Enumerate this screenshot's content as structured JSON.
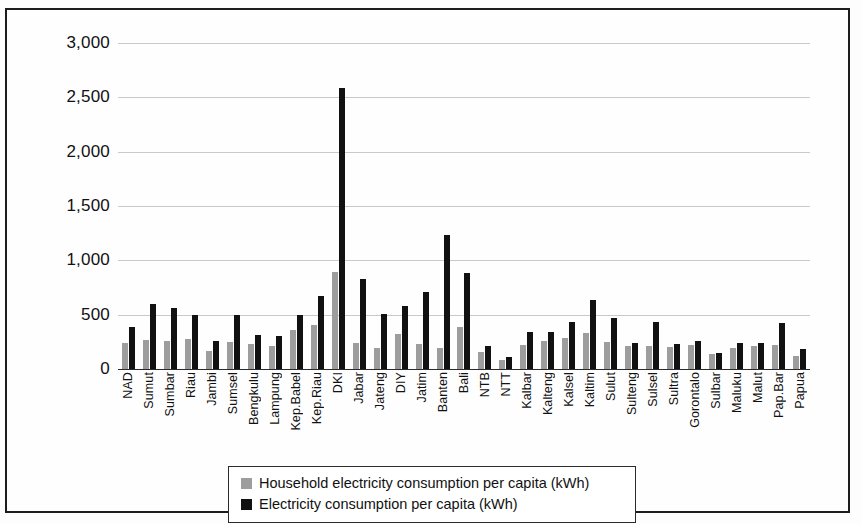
{
  "chart_data": {
    "type": "bar",
    "title": "",
    "xlabel": "",
    "ylabel": "",
    "ylim": [
      0,
      3000
    ],
    "ytick_labels": [
      "0",
      "500",
      "1,000",
      "1,500",
      "2,000",
      "2,500",
      "3,000"
    ],
    "ytick_values": [
      0,
      500,
      1000,
      1500,
      2000,
      2500,
      3000
    ],
    "grid": true,
    "legend_position": "bottom-center",
    "categories": [
      "NAD",
      "Sumut",
      "Sumbar",
      "Riau",
      "Jambi",
      "Sumsel",
      "Bengkulu",
      "Lampung",
      "Kep.Babel",
      "Kep.Riau",
      "DKI",
      "Jabar",
      "Jateng",
      "DIY",
      "Jatim",
      "Banten",
      "Bali",
      "NTB",
      "NTT",
      "Kalbar",
      "Kalteng",
      "Kalsel",
      "Kaltim",
      "Sulut",
      "Sulteng",
      "Sulsel",
      "Sultra",
      "Gorontalo",
      "Sulbar",
      "Maluku",
      "Malut",
      "Pap.Bar",
      "Papua"
    ],
    "series": [
      {
        "name": "Household electricity consumption per capita (kWh)",
        "color": "#9d9d9d",
        "values": [
          235,
          270,
          260,
          275,
          170,
          250,
          230,
          215,
          355,
          405,
          890,
          240,
          195,
          320,
          230,
          190,
          390,
          155,
          80,
          220,
          260,
          285,
          330,
          250,
          215,
          210,
          205,
          220,
          135,
          190,
          210,
          220,
          120
        ]
      },
      {
        "name": "Electricity consumption per capita (kWh)",
        "color": "#111111",
        "values": [
          385,
          595,
          560,
          495,
          255,
          495,
          310,
          300,
          500,
          675,
          2590,
          825,
          510,
          580,
          710,
          1235,
          880,
          210,
          115,
          345,
          340,
          435,
          635,
          465,
          240,
          435,
          230,
          255,
          150,
          240,
          235,
          425,
          185
        ]
      }
    ]
  },
  "legend": {
    "items": [
      {
        "label": "Household electricity consumption per capita (kWh)",
        "swatch": "gray-swatch"
      },
      {
        "label": "Electricity consumption per capita (kWh)",
        "swatch": "black-swatch"
      }
    ]
  }
}
